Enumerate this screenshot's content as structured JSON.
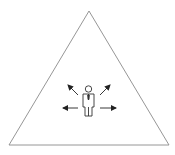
{
  "diagram": {
    "colors": {
      "background": "#ffffff",
      "triangle_stroke": "#8a8a8a",
      "figure_stroke": "#333333",
      "arrow_color": "#222222"
    },
    "triangle": {
      "points": [
        [
          89,
          11
        ],
        [
          9,
          145
        ],
        [
          169,
          145
        ]
      ]
    },
    "figure": {
      "icon": "person-with-tie-icon",
      "center": [
        88,
        100
      ]
    },
    "arrows": [
      {
        "direction": "up-left",
        "from": [
          78,
          95
        ],
        "to": [
          67,
          84
        ]
      },
      {
        "direction": "up-right",
        "from": [
          100,
          95
        ],
        "to": [
          111,
          84
        ]
      },
      {
        "direction": "left",
        "from": [
          78,
          108
        ],
        "to": [
          62,
          108
        ]
      },
      {
        "direction": "right",
        "from": [
          100,
          108
        ],
        "to": [
          116,
          108
        ]
      }
    ]
  }
}
